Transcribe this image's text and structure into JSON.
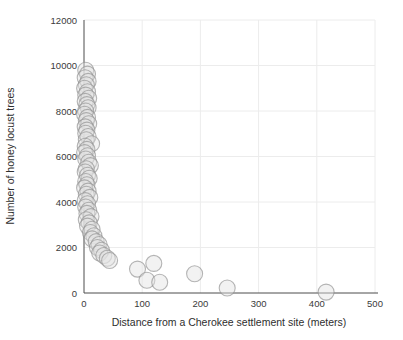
{
  "chart_data": {
    "type": "scatter",
    "title": "",
    "xlabel": "Distance from a Cherokee settlement site (meters)",
    "ylabel": "Number of  honey locust trees",
    "xlim": [
      0,
      500
    ],
    "ylim": [
      0,
      12000
    ],
    "x_ticks": [
      0,
      100,
      200,
      300,
      400,
      500
    ],
    "y_ticks": [
      0,
      2000,
      4000,
      6000,
      8000,
      10000,
      12000
    ],
    "grid": true,
    "legend": "none",
    "colors": {
      "background": "#ffffff",
      "grid": "#ececec",
      "axis": "#4d4d4d",
      "text": "#3a3a3a",
      "marker_fill": "#e3e3e3",
      "marker_stroke": "#8f8f8f"
    },
    "marker": {
      "radius_px": 8,
      "fill_opacity": 0.45,
      "stroke_opacity": 0.65,
      "stroke_width": 1.1
    },
    "series": [
      {
        "name": "honey-locust-counts-vs-distance",
        "points": [
          [
            3,
            9790
          ],
          [
            6,
            9620
          ],
          [
            2,
            9460
          ],
          [
            7,
            9300
          ],
          [
            4,
            9150
          ],
          [
            1,
            9000
          ],
          [
            6,
            8850
          ],
          [
            3,
            8700
          ],
          [
            8,
            8560
          ],
          [
            2,
            8420
          ],
          [
            5,
            8280
          ],
          [
            7,
            8140
          ],
          [
            3,
            8000
          ],
          [
            1,
            7860
          ],
          [
            6,
            7720
          ],
          [
            4,
            7580
          ],
          [
            8,
            7440
          ],
          [
            2,
            7300
          ],
          [
            5,
            7160
          ],
          [
            3,
            7020
          ],
          [
            7,
            6880
          ],
          [
            4,
            6740
          ],
          [
            13,
            6560
          ],
          [
            2,
            6450
          ],
          [
            5,
            6310
          ],
          [
            1,
            6170
          ],
          [
            6,
            6030
          ],
          [
            3,
            5890
          ],
          [
            8,
            5750
          ],
          [
            11,
            5600
          ],
          [
            4,
            5460
          ],
          [
            2,
            5320
          ],
          [
            6,
            5180
          ],
          [
            9,
            5040
          ],
          [
            3,
            4900
          ],
          [
            5,
            4760
          ],
          [
            1,
            4620
          ],
          [
            7,
            4480
          ],
          [
            4,
            4340
          ],
          [
            10,
            4200
          ],
          [
            2,
            4060
          ],
          [
            6,
            3920
          ],
          [
            3,
            3780
          ],
          [
            8,
            3640
          ],
          [
            5,
            3500
          ],
          [
            12,
            3360
          ],
          [
            4,
            3220
          ],
          [
            9,
            3080
          ],
          [
            6,
            2940
          ],
          [
            14,
            2800
          ],
          [
            11,
            2660
          ],
          [
            17,
            2520
          ],
          [
            14,
            2380
          ],
          [
            21,
            2260
          ],
          [
            26,
            2130
          ],
          [
            23,
            2000
          ],
          [
            30,
            1880
          ],
          [
            27,
            1760
          ],
          [
            34,
            1650
          ],
          [
            40,
            1530
          ],
          [
            44,
            1430
          ],
          [
            92,
            1050
          ],
          [
            108,
            560
          ],
          [
            120,
            1300
          ],
          [
            130,
            470
          ],
          [
            190,
            850
          ],
          [
            246,
            220
          ],
          [
            416,
            40
          ]
        ]
      }
    ]
  }
}
